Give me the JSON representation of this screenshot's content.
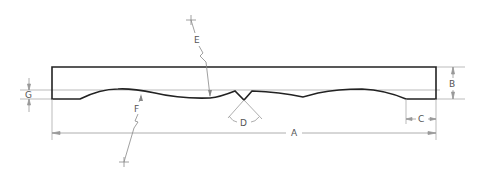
{
  "diagram": {
    "colors": {
      "outline": "#222222",
      "dim_line": "#999999",
      "label": "#555555",
      "background": "#ffffff"
    },
    "labels": {
      "A": "A",
      "B": "B",
      "C": "C",
      "D": "D",
      "E": "E",
      "F": "F",
      "G": "G"
    },
    "dimensions": [
      {
        "id": "A",
        "meaning": "overall length"
      },
      {
        "id": "B",
        "meaning": "overall height"
      },
      {
        "id": "C",
        "meaning": "end flat length"
      },
      {
        "id": "D",
        "meaning": "V-notch angle"
      },
      {
        "id": "E",
        "meaning": "scallop radius (upper)"
      },
      {
        "id": "F",
        "meaning": "scallop radius (lower)"
      },
      {
        "id": "G",
        "meaning": "scallop depth"
      }
    ]
  }
}
